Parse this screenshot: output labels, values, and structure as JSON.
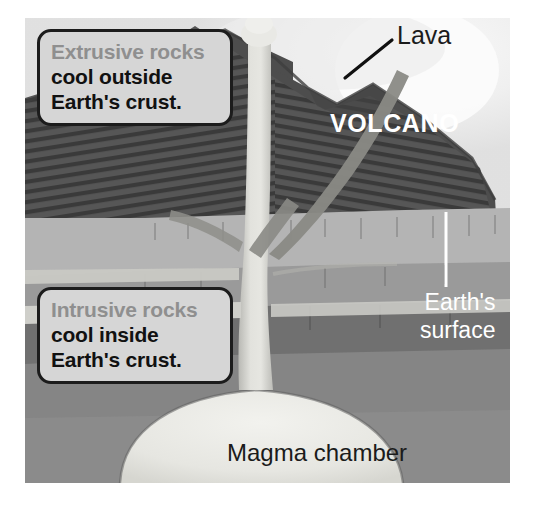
{
  "figure": {
    "canvas": {
      "x": 25,
      "y": 18,
      "width": 485,
      "height": 465
    }
  },
  "callouts": [
    {
      "id": "extrusive",
      "heading": "Extrusive rocks",
      "line2": "cool outside",
      "line3": "Earth's crust.",
      "heading_color": "#8f8f8f",
      "body_color": "#111111",
      "box_fill": "#d6d6d6",
      "box_border": "#1c1c1c"
    },
    {
      "id": "intrusive",
      "heading": "Intrusive rocks",
      "line2": "cool inside",
      "line3": "Earth's crust.",
      "heading_color": "#8f8f8f",
      "body_color": "#111111",
      "box_fill": "#d6d6d6",
      "box_border": "#1c1c1c"
    }
  ],
  "labels": {
    "lava": "Lava",
    "volcano": "VOLCANO",
    "earth_surface_line1": "Earth's",
    "earth_surface_line2": "surface",
    "magma_chamber": "Magma chamber"
  },
  "colors": {
    "sky": "#e4e4e4",
    "sky_glow": "#f4f4f4",
    "volcano_cone": "#5b5b5b",
    "volcano_cone_dark": "#4a4a4a",
    "volcano_strata": "#3b3b3b",
    "crust_light": "#b6b6b6",
    "crust_mid": "#9d9d9d",
    "crust_dark": "#777777",
    "crust_darkest": "#6a6a6a",
    "magma": "#e6e6e2",
    "conduit": "#d9d9d5",
    "label_white": "#ffffff",
    "label_black": "#1b1b1b",
    "pointer_line": "#ffffff",
    "leader_line": "#111111"
  },
  "annotations": {
    "lava_leader": {
      "from_x": 392,
      "from_y": 40,
      "to_x": 345,
      "to_y": 78
    },
    "surface_pointer": {
      "x": 446,
      "y_top": 212,
      "y_bottom": 287
    }
  }
}
